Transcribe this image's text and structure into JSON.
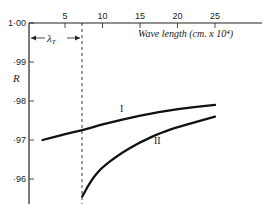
{
  "chart_data": {
    "type": "line",
    "title": "",
    "xlabel": "Wave length (cm. x 10⁴)",
    "ylabel": "R",
    "xlim": [
      0,
      25
    ],
    "ylim": [
      0.955,
      1.0
    ],
    "x_ticks": [
      5,
      10,
      15,
      20,
      25
    ],
    "x_tick_labels": [
      "5",
      "10",
      "15",
      "20",
      "25"
    ],
    "x_axis_position": "top",
    "y_ticks": [
      1.0,
      0.99,
      0.98,
      0.97,
      0.96
    ],
    "y_tick_labels": [
      "1·00",
      "·99",
      "·98",
      "·97",
      "·96"
    ],
    "grid": false,
    "legend": "inline labels",
    "annotations": [
      {
        "text": "λᴛ",
        "label": "lambda_T",
        "type": "double-arrow span",
        "x_from": 0,
        "x_to": 7.3
      },
      {
        "type": "vertical dashed line",
        "x": 7.3
      }
    ],
    "series": [
      {
        "name": "I",
        "x": [
          2,
          5,
          7.3,
          10,
          15,
          20,
          25
        ],
        "values": [
          0.97,
          0.9715,
          0.9725,
          0.974,
          0.9763,
          0.978,
          0.979
        ]
      },
      {
        "name": "II",
        "x": [
          7.3,
          8,
          9,
          10,
          12,
          15,
          18,
          20,
          25
        ],
        "values": [
          0.9555,
          0.958,
          0.961,
          0.963,
          0.966,
          0.9695,
          0.972,
          0.9733,
          0.976
        ]
      }
    ]
  }
}
